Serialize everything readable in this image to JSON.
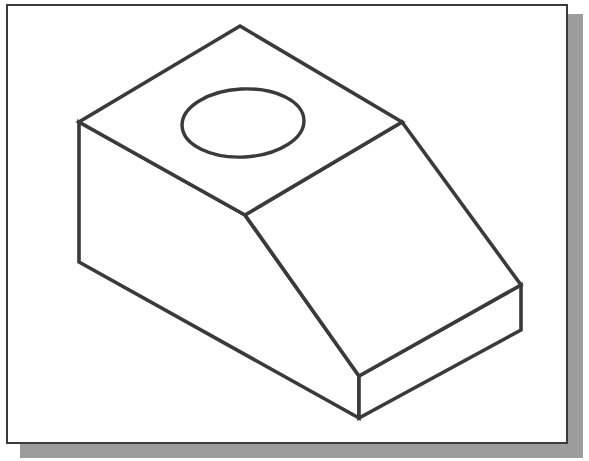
{
  "figure": {
    "type": "isometric-line-drawing",
    "canvas": {
      "width": 589,
      "height": 461
    },
    "frame": {
      "label": "image-border",
      "x": 6,
      "y": 4,
      "width": 562,
      "height": 440,
      "border_color": "#3a3a3a",
      "border_width": 2,
      "fill_color": "#ffffff"
    },
    "shadow": {
      "label": "drop-shadow",
      "x": 20,
      "y": 14,
      "width": 563,
      "height": 444,
      "color": "#9c9c9c"
    },
    "line_color": "#3a3a3a",
    "line_width": 3.6,
    "fill_color": "#ffffff",
    "vertices": {
      "top_back_apex": [
        240,
        26
      ],
      "top_right": [
        402,
        122
      ],
      "top_left": [
        79,
        122
      ],
      "top_front_mid": [
        245,
        215
      ],
      "slant_bottom_right": [
        521,
        285
      ],
      "slant_bottom_front": [
        359,
        376
      ],
      "front_right_lower": [
        521,
        330
      ],
      "front_bottom": [
        359,
        418
      ],
      "left_lower": [
        79,
        262
      ]
    },
    "faces": [
      {
        "name": "top-face",
        "points": "240,26 402,122 245,215 79,122"
      },
      {
        "name": "slanted-face",
        "points": "402,122 521,285 359,376 245,215"
      },
      {
        "name": "left-front-face",
        "points": "79,122 245,215 359,376 359,418 79,262"
      },
      {
        "name": "right-front-face",
        "points": "359,376 521,285 521,330 359,418"
      }
    ],
    "hole": {
      "name": "circular-hole-ellipse",
      "cx": 243,
      "cy": 123,
      "rx": 61,
      "ry": 34,
      "rotation_deg": -3
    }
  }
}
